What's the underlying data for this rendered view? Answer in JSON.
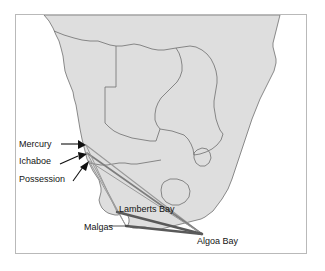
{
  "figure": {
    "kind": "map",
    "frame": {
      "border_color": "#b9b9b9",
      "background": "#ffffff"
    }
  },
  "map": {
    "land_fill": "#dedede",
    "land_stroke": "#6e6e6e",
    "border_stroke": "#6e6e6e",
    "ocean_fill": "#ffffff",
    "regions": [
      "Angola",
      "Namibia",
      "Botswana",
      "Zimbabwe",
      "Mozambique",
      "South Africa",
      "Lesotho",
      "Swaziland"
    ]
  },
  "labels": [
    {
      "id": "mercury",
      "text": "Mercury",
      "pointer": "arrow-right"
    },
    {
      "id": "ichaboe",
      "text": "Ichaboe",
      "pointer": "arrow-right"
    },
    {
      "id": "possession",
      "text": "Possession",
      "pointer": "arrow-up-right"
    },
    {
      "id": "lamberts",
      "text": "Lamberts Bay",
      "pointer": "none"
    },
    {
      "id": "malgas",
      "text": "Malgas",
      "pointer": "line-right"
    },
    {
      "id": "algoa",
      "text": "Algoa Bay",
      "pointer": "none"
    }
  ],
  "sites": {
    "mercury": {
      "label": "Mercury",
      "x": 70,
      "y": 130
    },
    "ichaboe": {
      "label": "Ichaboe",
      "x": 71,
      "y": 138
    },
    "possession": {
      "label": "Possession",
      "x": 73,
      "y": 146
    },
    "lamberts_bay": {
      "label": "Lamberts Bay",
      "x": 101,
      "y": 197
    },
    "malgas": {
      "label": "Malgas",
      "x": 110,
      "y": 211
    },
    "algoa_bay": {
      "label": "Algoa Bay",
      "x": 186,
      "y": 219
    }
  },
  "connections": {
    "hub": "Algoa Bay",
    "line_color_dark": "#5a5a5a",
    "line_color_light": "#9a9a9a",
    "links": [
      {
        "from": "Mercury",
        "to": "Algoa Bay",
        "weight": "thin"
      },
      {
        "from": "Ichaboe",
        "to": "Algoa Bay",
        "weight": "medium"
      },
      {
        "from": "Possession",
        "to": "Algoa Bay",
        "weight": "thin"
      },
      {
        "from": "Lamberts Bay",
        "to": "Algoa Bay",
        "weight": "thick"
      },
      {
        "from": "Malgas",
        "to": "Algoa Bay",
        "weight": "thick"
      },
      {
        "from": "Mercury",
        "to": "Lamberts Bay",
        "weight": "thin"
      },
      {
        "from": "Ichaboe",
        "to": "Malgas",
        "weight": "thin"
      },
      {
        "from": "Possession",
        "to": "Malgas",
        "weight": "thin"
      }
    ]
  }
}
